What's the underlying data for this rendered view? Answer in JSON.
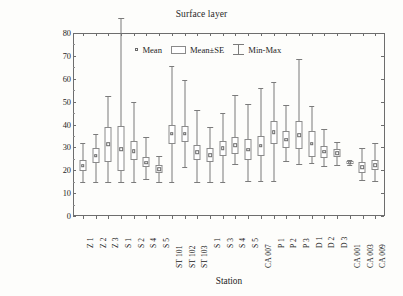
{
  "chart_data": {
    "type": "box",
    "title": "Surface layer",
    "xlabel": "Station",
    "ylabel_main": "Abundance of Prochlorococcus x 10",
    "ylabel_exponent": "3",
    "ylabel_unit": " cell",
    "ylabel_sub": "mL",
    "ylabel_sub_exponent": "-1",
    "ylim": [
      0,
      80
    ],
    "ytick_labels": [
      "0",
      "10",
      "20",
      "30",
      "40",
      "50",
      "60",
      "70",
      "80"
    ],
    "ytick_values": [
      0,
      10,
      20,
      30,
      40,
      50,
      60,
      70,
      80
    ],
    "grid": false,
    "legend_position": "top-center",
    "legend": [
      {
        "label": "Mean",
        "symbol": "small-square-marker"
      },
      {
        "label": "Mean±SE",
        "symbol": "open-box"
      },
      {
        "label": "Min-Max",
        "symbol": "whisker-bar"
      }
    ],
    "categories": [
      "Z 1",
      "Z 2",
      "Z 3",
      "S 1",
      "S 2",
      "S 4",
      "S 5",
      "ST 101",
      "ST 102",
      "ST 103",
      "S 1",
      "S 3",
      "S 4",
      "S 5",
      "CA 007",
      "P 1",
      "P 2",
      "P 3",
      "D 1",
      "D 2",
      "D 3",
      "CA 001",
      "CA 003",
      "CA 009"
    ],
    "series": [
      {
        "category": "Z 1",
        "min": 0.3,
        "se_low": 5.2,
        "mean": 7.5,
        "se_high": 10.2,
        "max": 17.3
      },
      {
        "category": "Z 2",
        "min": 0.4,
        "se_low": 8.9,
        "mean": 11.9,
        "se_high": 15.1,
        "max": 21.5
      },
      {
        "category": "Z 3",
        "min": 0.4,
        "se_low": 9.2,
        "mean": 16.9,
        "se_high": 24.4,
        "max": 38.2
      },
      {
        "category": "S 1",
        "min": 0.3,
        "se_low": 5.3,
        "mean": 14.8,
        "se_high": 24.9,
        "max": 72.2
      },
      {
        "category": "S 2",
        "min": 0.3,
        "se_low": 9.9,
        "mean": 14.0,
        "se_high": 18.3,
        "max": 35.6
      },
      {
        "category": "S 4",
        "min": 1.7,
        "se_low": 6.9,
        "mean": 8.9,
        "se_high": 11.4,
        "max": 20.1
      },
      {
        "category": "S 5",
        "min": 0.5,
        "se_low": 4.4,
        "mean": 6.1,
        "se_high": 7.8,
        "max": 12.0
      },
      {
        "category": "ST 101",
        "min": 0.4,
        "se_low": 17.1,
        "mean": 21.5,
        "se_high": 25.5,
        "max": 51.1
      },
      {
        "category": "ST 102",
        "min": 7.2,
        "se_low": 18.1,
        "mean": 21.5,
        "se_high": 24.9,
        "max": 44.9
      },
      {
        "category": "ST 103",
        "min": 0.6,
        "se_low": 10.1,
        "mean": 13.4,
        "se_high": 16.6,
        "max": 32.1
      },
      {
        "category": "S 1",
        "min": 0.5,
        "se_low": 9.3,
        "mean": 12.1,
        "se_high": 15.2,
        "max": 24.3
      },
      {
        "category": "S 3",
        "min": 0.4,
        "se_low": 11.8,
        "mean": 15.1,
        "se_high": 18.2,
        "max": 30.4
      },
      {
        "category": "S 4",
        "min": 8.1,
        "se_low": 12.6,
        "mean": 16.4,
        "se_high": 20.3,
        "max": 38.5
      },
      {
        "category": "S 5",
        "min": 0.7,
        "se_low": 10.0,
        "mean": 14.6,
        "se_high": 19.2,
        "max": 34.5
      },
      {
        "category": "CA 007",
        "min": 0.7,
        "se_low": 12.0,
        "mean": 16.3,
        "se_high": 20.5,
        "max": 41.4
      },
      {
        "category": "P 1",
        "min": 0.7,
        "se_low": 17.0,
        "mean": 22.3,
        "se_high": 27.2,
        "max": 44.0
      },
      {
        "category": "P 2",
        "min": 9.5,
        "se_low": 15.2,
        "mean": 19.0,
        "se_high": 22.8,
        "max": 34.2
      },
      {
        "category": "P 3",
        "min": 8.2,
        "se_low": 15.0,
        "mean": 21.0,
        "se_high": 27.1,
        "max": 54.4
      },
      {
        "category": "D 1",
        "min": 8.7,
        "se_low": 11.5,
        "mean": 17.2,
        "se_high": 22.8,
        "max": 33.5
      },
      {
        "category": "D 2",
        "min": 7.4,
        "se_low": 11.0,
        "mean": 13.6,
        "se_high": 16.3,
        "max": 23.6
      },
      {
        "category": "D 3",
        "min": 7.9,
        "se_low": 11.2,
        "mean": 12.9,
        "se_high": 14.9,
        "max": 18.0
      },
      {
        "category": "CA 001",
        "min": 7.9,
        "se_low": 8.5,
        "mean": 8.9,
        "se_high": 9.5,
        "max": 10.0
      },
      {
        "category": "CA 003",
        "min": 1.1,
        "se_low": 4.5,
        "mean": 6.8,
        "se_high": 9.2,
        "max": 15.3
      },
      {
        "category": "CA 009",
        "min": 1.0,
        "se_low": 5.7,
        "mean": 7.9,
        "se_high": 10.0,
        "max": 17.5
      }
    ]
  }
}
